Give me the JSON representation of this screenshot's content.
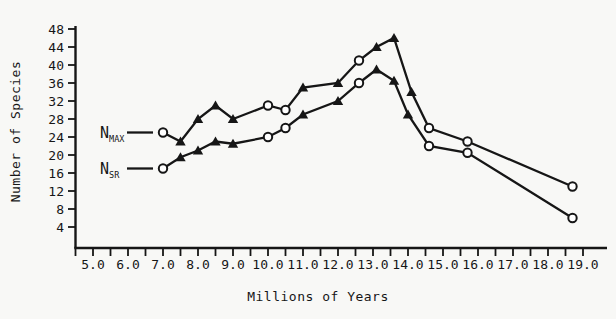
{
  "figure": {
    "background": "#f8f8f6",
    "ink": "#161616"
  },
  "chart_data": {
    "type": "line",
    "title": "",
    "xlabel": "Millions of Years",
    "ylabel": "Number of Species",
    "xlim": [
      4.5,
      19.4
    ],
    "ylim": [
      0,
      48
    ],
    "grid": false,
    "legend_position": "inline-left",
    "xticks_major": [
      {
        "v": 5,
        "label": "5.0"
      },
      {
        "v": 6,
        "label": "6.0"
      },
      {
        "v": 7,
        "label": "7.0"
      },
      {
        "v": 8,
        "label": "8.0"
      },
      {
        "v": 9,
        "label": "9.0"
      },
      {
        "v": 10,
        "label": "10.0"
      },
      {
        "v": 11,
        "label": "11.0"
      },
      {
        "v": 12,
        "label": "12.0"
      },
      {
        "v": 13,
        "label": "13.0"
      },
      {
        "v": 14,
        "label": "14.0"
      },
      {
        "v": 15,
        "label": "15.0"
      },
      {
        "v": 16,
        "label": "16.0"
      },
      {
        "v": 17,
        "label": "17.0"
      },
      {
        "v": 18,
        "label": "18.0"
      },
      {
        "v": 19,
        "label": "19.0"
      }
    ],
    "xtick_minor_start": 4.5,
    "xtick_minor_step": 0.5,
    "xtick_minor_end": 19.0,
    "yticks": [
      {
        "v": 4,
        "label": "4"
      },
      {
        "v": 8,
        "label": "8"
      },
      {
        "v": 12,
        "label": "12"
      },
      {
        "v": 16,
        "label": "16"
      },
      {
        "v": 20,
        "label": "20"
      },
      {
        "v": 24,
        "label": "24"
      },
      {
        "v": 28,
        "label": "28"
      },
      {
        "v": 32,
        "label": "32"
      },
      {
        "v": 36,
        "label": "36"
      },
      {
        "v": 40,
        "label": "40"
      },
      {
        "v": 44,
        "label": "44"
      },
      {
        "v": 48,
        "label": "48"
      }
    ],
    "marker_legend": {
      "triangle": "filled black up-triangle",
      "circle": "open white circle"
    },
    "series": [
      {
        "name": "N_MAX",
        "legend_main": "N",
        "legend_sub": "MAX",
        "points": [
          {
            "x": 7.0,
            "y": 25,
            "marker": "circle"
          },
          {
            "x": 7.5,
            "y": 23,
            "marker": "triangle"
          },
          {
            "x": 8.0,
            "y": 28,
            "marker": "triangle"
          },
          {
            "x": 8.5,
            "y": 31,
            "marker": "triangle"
          },
          {
            "x": 9.0,
            "y": 28,
            "marker": "triangle"
          },
          {
            "x": 10.0,
            "y": 31,
            "marker": "circle"
          },
          {
            "x": 10.5,
            "y": 30,
            "marker": "circle"
          },
          {
            "x": 11.0,
            "y": 35,
            "marker": "triangle"
          },
          {
            "x": 12.0,
            "y": 36,
            "marker": "triangle"
          },
          {
            "x": 12.6,
            "y": 41,
            "marker": "circle"
          },
          {
            "x": 13.1,
            "y": 44,
            "marker": "triangle"
          },
          {
            "x": 13.6,
            "y": 46,
            "marker": "triangle"
          },
          {
            "x": 14.1,
            "y": 34,
            "marker": "triangle"
          },
          {
            "x": 14.6,
            "y": 26,
            "marker": "circle"
          },
          {
            "x": 15.7,
            "y": 23,
            "marker": "circle"
          },
          {
            "x": 18.7,
            "y": 13,
            "marker": "circle"
          }
        ]
      },
      {
        "name": "N_SR",
        "legend_main": "N",
        "legend_sub": "SR",
        "points": [
          {
            "x": 7.0,
            "y": 17,
            "marker": "circle"
          },
          {
            "x": 7.5,
            "y": 19.5,
            "marker": "triangle"
          },
          {
            "x": 8.0,
            "y": 21,
            "marker": "triangle"
          },
          {
            "x": 8.5,
            "y": 23,
            "marker": "triangle"
          },
          {
            "x": 9.0,
            "y": 22.5,
            "marker": "triangle"
          },
          {
            "x": 10.0,
            "y": 24,
            "marker": "circle"
          },
          {
            "x": 10.5,
            "y": 26,
            "marker": "circle"
          },
          {
            "x": 11.0,
            "y": 29,
            "marker": "triangle"
          },
          {
            "x": 12.0,
            "y": 32,
            "marker": "triangle"
          },
          {
            "x": 12.6,
            "y": 36,
            "marker": "circle"
          },
          {
            "x": 13.1,
            "y": 39,
            "marker": "triangle"
          },
          {
            "x": 13.6,
            "y": 36.5,
            "marker": "triangle"
          },
          {
            "x": 14.0,
            "y": 29,
            "marker": "triangle"
          },
          {
            "x": 14.6,
            "y": 22,
            "marker": "circle"
          },
          {
            "x": 15.7,
            "y": 20.5,
            "marker": "circle"
          },
          {
            "x": 18.7,
            "y": 6,
            "marker": "circle"
          }
        ]
      }
    ]
  }
}
